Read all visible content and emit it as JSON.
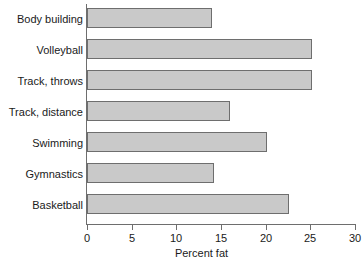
{
  "chart_data": {
    "type": "bar",
    "orientation": "horizontal",
    "title": "",
    "subtitle": "",
    "xlabel": "Percent fat",
    "ylabel": "",
    "categories": [
      "Body building",
      "Volleyball",
      "Track, throws",
      "Track, distance",
      "Swimming",
      "Gymnastics",
      "Basketball"
    ],
    "values": [
      14.0,
      25.2,
      25.2,
      16.0,
      20.1,
      14.2,
      22.6
    ],
    "xlim": [
      0,
      30
    ],
    "xticks": [
      0,
      5,
      10,
      15,
      20,
      25,
      30
    ],
    "xtick_labels": [
      "0",
      "5",
      "10",
      "15",
      "20",
      "25",
      "30"
    ],
    "grid": false,
    "legend": false,
    "legend_position": "none",
    "bar_fill_color": "#c9c9c9",
    "bar_border_color": "#6e6e6e",
    "axis_color": "#6e6e6e",
    "text_color": "#1a1a1a",
    "background_color": "#ffffff"
  }
}
